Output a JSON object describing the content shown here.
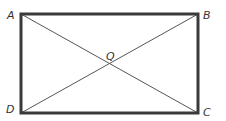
{
  "diagram": {
    "type": "rectangle-with-diagonals",
    "vertices": {
      "A": {
        "label": "A",
        "x": 21,
        "y": 14
      },
      "B": {
        "label": "B",
        "x": 198,
        "y": 14
      },
      "C": {
        "label": "C",
        "x": 198,
        "y": 113
      },
      "D": {
        "label": "D",
        "x": 21,
        "y": 113
      }
    },
    "intersection": {
      "label": "Q"
    },
    "colors": {
      "border": "#3a3a3a",
      "diagonal": "#555555",
      "label": "#333333",
      "background": "#ffffff"
    }
  }
}
